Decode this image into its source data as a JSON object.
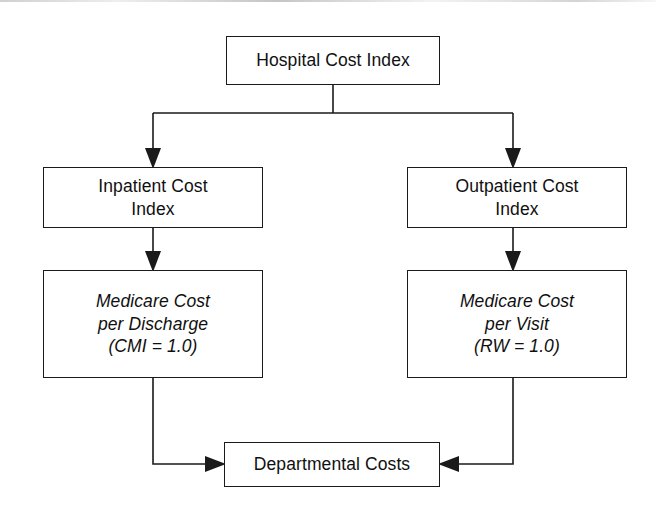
{
  "diagram": {
    "type": "flowchart",
    "orientation": "top-down",
    "background_color": "#ffffff",
    "line_color": "#1a1a1a",
    "text_color": "#101010",
    "nodes": [
      {
        "id": "hospital-cost-index",
        "label": "Hospital Cost Index",
        "style": "plain",
        "x": 226,
        "y": 36,
        "width": 214,
        "height": 49
      },
      {
        "id": "inpatient-cost-index",
        "label": "Inpatient Cost\nIndex",
        "style": "plain",
        "x": 43,
        "y": 167,
        "width": 220,
        "height": 61
      },
      {
        "id": "outpatient-cost-index",
        "label": "Outpatient Cost\nIndex",
        "style": "plain",
        "x": 407,
        "y": 167,
        "width": 220,
        "height": 61
      },
      {
        "id": "medicare-cost-per-discharge",
        "label": "Medicare Cost\nper Discharge\n(CMI = 1.0)",
        "style": "italic",
        "x": 43,
        "y": 270,
        "width": 220,
        "height": 108
      },
      {
        "id": "medicare-cost-per-visit",
        "label": "Medicare Cost\nper Visit\n(RW = 1.0)",
        "style": "italic",
        "x": 407,
        "y": 270,
        "width": 220,
        "height": 108
      },
      {
        "id": "departmental-costs",
        "label": "Departmental Costs",
        "style": "plain",
        "x": 224,
        "y": 442,
        "width": 216,
        "height": 45
      }
    ],
    "edges": [
      {
        "id": "edge-hospital-to-inpatient",
        "from": "hospital-cost-index",
        "to": "inpatient-cost-index",
        "arrowhead": "down"
      },
      {
        "id": "edge-hospital-to-outpatient",
        "from": "hospital-cost-index",
        "to": "outpatient-cost-index",
        "arrowhead": "down"
      },
      {
        "id": "edge-inpatient-to-discharge",
        "from": "inpatient-cost-index",
        "to": "medicare-cost-per-discharge",
        "arrowhead": "down"
      },
      {
        "id": "edge-outpatient-to-visit",
        "from": "outpatient-cost-index",
        "to": "medicare-cost-per-visit",
        "arrowhead": "down"
      },
      {
        "id": "edge-discharge-to-departmental",
        "from": "medicare-cost-per-discharge",
        "to": "departmental-costs",
        "arrowhead": "right"
      },
      {
        "id": "edge-visit-to-departmental",
        "from": "medicare-cost-per-visit",
        "to": "departmental-costs",
        "arrowhead": "left"
      }
    ]
  }
}
